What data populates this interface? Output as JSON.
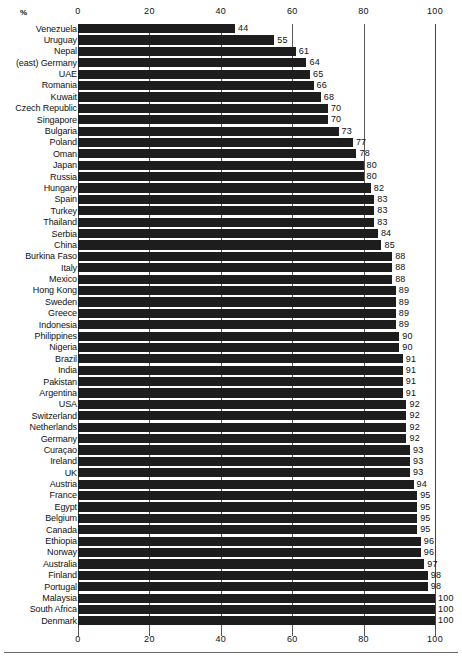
{
  "chart_data": {
    "type": "bar",
    "orientation": "horizontal",
    "title": "",
    "xlabel": "%",
    "ylabel": "",
    "xlim": [
      0,
      100
    ],
    "ticks": [
      0,
      20,
      40,
      60,
      80,
      100
    ],
    "grid": true,
    "legend": null,
    "axis_top": true,
    "axis_bottom": true,
    "unit_label": "%",
    "categories": [
      "Venezuela",
      "Uruguay",
      "Nepal",
      "(east) Germany",
      "UAE",
      "Romania",
      "Kuwait",
      "Czech Republic",
      "Singapore",
      "Bulgaria",
      "Poland",
      "Oman",
      "Japan",
      "Russia",
      "Hungary",
      "Spain",
      "Turkey",
      "Thailand",
      "Serbia",
      "China",
      "Burkina Faso",
      "Italy",
      "Mexico",
      "Hong Kong",
      "Sweden",
      "Greece",
      "Indonesia",
      "Philippines",
      "Nigeria",
      "Brazil",
      "India",
      "Pakistan",
      "Argentina",
      "USA",
      "Switzerland",
      "Netherlands",
      "Germany",
      "Curaçao",
      "Ireland",
      "UK",
      "Austria",
      "France",
      "Egypt",
      "Belgium",
      "Canada",
      "Ethiopia",
      "Norway",
      "Australia",
      "Finland",
      "Portugal",
      "Malaysia",
      "South Africa",
      "Denmark"
    ],
    "values": [
      44,
      55,
      61,
      64,
      65,
      66,
      68,
      70,
      70,
      73,
      77,
      78,
      80,
      80,
      82,
      83,
      83,
      83,
      84,
      85,
      88,
      88,
      88,
      89,
      89,
      89,
      89,
      90,
      90,
      91,
      91,
      91,
      91,
      92,
      92,
      92,
      92,
      93,
      93,
      93,
      94,
      95,
      95,
      95,
      95,
      96,
      96,
      97,
      98,
      98,
      100,
      100,
      100
    ],
    "value_labels": [
      "44",
      "55",
      "61",
      "64",
      "65",
      "66",
      "68",
      "70",
      "70",
      "73",
      "77",
      "78",
      "80",
      "80",
      "82",
      "83",
      "83",
      "83",
      "84",
      "85",
      "88",
      "88",
      "88",
      "89",
      "89",
      "89",
      "89",
      "90",
      "90",
      "91",
      "91",
      "91",
      "91",
      "92",
      "92",
      "92",
      "92",
      "93",
      "93",
      "93",
      "94",
      "95",
      "95",
      "95",
      "95",
      "96",
      "96",
      "97",
      "98",
      "98",
      "100",
      "100",
      "100"
    ],
    "bar_color": "#1d1d1d",
    "background_color": "#ffffff"
  },
  "axis": {
    "tick_labels": [
      "0",
      "20",
      "40",
      "60",
      "80",
      "100"
    ]
  }
}
